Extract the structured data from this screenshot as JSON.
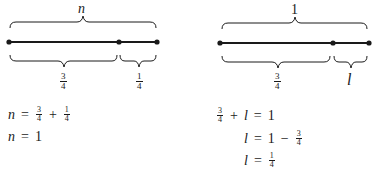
{
  "left_diagram": {
    "top_label": "n",
    "segments": [
      {
        "label_num": "3",
        "label_den": "4"
      },
      {
        "label_num": "1",
        "label_den": "4"
      }
    ]
  },
  "right_diagram": {
    "top_label": "1",
    "segments": [
      {
        "label_num": "3",
        "label_den": "4"
      },
      {
        "label": "l"
      }
    ]
  },
  "left_equations": [
    {
      "lhs": "n",
      "eq": "=",
      "t1_num": "3",
      "t1_den": "4",
      "op": "+",
      "t2_num": "1",
      "t2_den": "4"
    },
    {
      "lhs": "n",
      "eq": "=",
      "rhs": "1"
    }
  ],
  "right_equations": [
    {
      "t1_num": "3",
      "t1_den": "4",
      "op": "+",
      "var": "l",
      "eq": "=",
      "rhs": "1"
    },
    {
      "lhs": "l",
      "eq": "=",
      "a": "1",
      "op": "−",
      "b_num": "3",
      "b_den": "4"
    },
    {
      "lhs": "l",
      "eq": "=",
      "r_num": "1",
      "r_den": "4"
    }
  ]
}
